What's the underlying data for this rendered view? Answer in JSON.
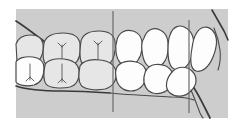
{
  "figure": {
    "title": "Lateral buccal view of dental occlusion",
    "width": 244,
    "height": 124
  },
  "colors": {
    "page_background": "#ffffff",
    "field_background": "#cdcdcd",
    "posterior_tooth_fill": "#e6e6e6",
    "anterior_tooth_fill": "#fdfdfd",
    "outline": "#4a4a4a",
    "heavy_outline": "#3a3a3a",
    "fissure_line": "#555555",
    "reference_line": "#6b6b6b"
  },
  "field": {
    "name": "gray-field",
    "x": 16,
    "y": 9,
    "width": 212,
    "height": 109
  },
  "reference_lines": [
    {
      "id": "line-1",
      "label": "anterior reference line 1",
      "x": 113,
      "y_top": 11,
      "y_bottom": 112
    },
    {
      "id": "line-2",
      "label": "anterior reference line 2",
      "x": 189,
      "y_top": 20,
      "y_bottom": 113
    }
  ],
  "upper_arch": {
    "label": "upper dental arch",
    "teeth": [
      {
        "id": "u1",
        "name": "upper-molar-distal",
        "type": "posterior",
        "fill": "posterior",
        "fissure": false
      },
      {
        "id": "u2",
        "name": "upper-first-molar",
        "type": "posterior",
        "fill": "posterior",
        "fissure": true
      },
      {
        "id": "u3",
        "name": "upper-second-premolar",
        "type": "posterior",
        "fill": "posterior",
        "fissure": true
      },
      {
        "id": "u4",
        "name": "upper-first-premolar",
        "type": "anterior",
        "fill": "anterior",
        "fissure": false
      },
      {
        "id": "u5",
        "name": "upper-canine",
        "type": "anterior",
        "fill": "anterior",
        "fissure": false
      },
      {
        "id": "u6",
        "name": "upper-lateral-incisor",
        "type": "anterior",
        "fill": "anterior",
        "fissure": false
      },
      {
        "id": "u7",
        "name": "upper-central-incisor",
        "type": "anterior",
        "fill": "anterior",
        "fissure": false
      }
    ]
  },
  "lower_arch": {
    "label": "lower dental arch",
    "teeth": [
      {
        "id": "l1",
        "name": "lower-molar-distal",
        "type": "posterior",
        "fill": "anterior",
        "fissure": true
      },
      {
        "id": "l2",
        "name": "lower-first-molar",
        "type": "posterior",
        "fill": "posterior",
        "fissure": true
      },
      {
        "id": "l3",
        "name": "lower-second-premolar",
        "type": "posterior",
        "fill": "posterior",
        "fissure": false
      },
      {
        "id": "l4",
        "name": "lower-first-premolar",
        "type": "anterior",
        "fill": "anterior",
        "fissure": false
      },
      {
        "id": "l5",
        "name": "lower-canine",
        "type": "anterior",
        "fill": "anterior",
        "fissure": false
      },
      {
        "id": "l6",
        "name": "lower-incisor",
        "type": "anterior",
        "fill": "anterior",
        "fissure": false
      }
    ]
  },
  "soft_tissue": {
    "upper_ridge_label": "upper alveolar ridge contour",
    "lower_ridge_label": "lower alveolar ridge contour",
    "lip_label": "anterior lip / gingival contour"
  }
}
